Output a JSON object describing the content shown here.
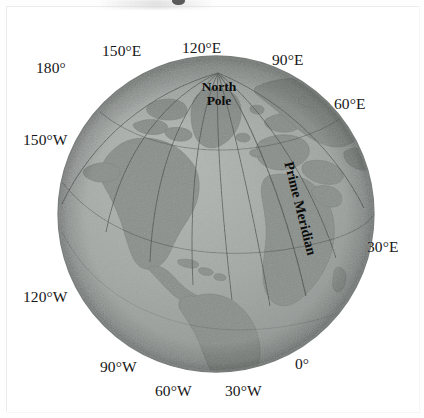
{
  "figure": {
    "type": "globe-diagram",
    "projection": "orthographic",
    "pole_label_line1": "North",
    "pole_label_line2": "Pole",
    "prime_meridian_label": "Prime Meridian",
    "colors": {
      "ocean": "#9fa5a2",
      "land": "#8b918d",
      "graticule": "#4d5250",
      "outline": "#6e7472",
      "text": "#141414",
      "page": "#ffffff"
    }
  },
  "meridian_labels": [
    {
      "id": "180",
      "text": "180°",
      "degrees": 180,
      "hemisphere": "",
      "position": "top-left"
    },
    {
      "id": "150E",
      "text": "150°E",
      "degrees": 150,
      "hemisphere": "E",
      "position": "top"
    },
    {
      "id": "120E",
      "text": "120°E",
      "degrees": 120,
      "hemisphere": "E",
      "position": "top"
    },
    {
      "id": "90E",
      "text": "90°E",
      "degrees": 90,
      "hemisphere": "E",
      "position": "top-right"
    },
    {
      "id": "60E",
      "text": "60°E",
      "degrees": 60,
      "hemisphere": "E",
      "position": "right-upper"
    },
    {
      "id": "30E",
      "text": "30°E",
      "degrees": 30,
      "hemisphere": "E",
      "position": "right"
    },
    {
      "id": "0",
      "text": "0°",
      "degrees": 0,
      "hemisphere": "",
      "position": "bottom-right"
    },
    {
      "id": "30W",
      "text": "30°W",
      "degrees": 30,
      "hemisphere": "W",
      "position": "bottom"
    },
    {
      "id": "60W",
      "text": "60°W",
      "degrees": 60,
      "hemisphere": "W",
      "position": "bottom"
    },
    {
      "id": "90W",
      "text": "90°W",
      "degrees": 90,
      "hemisphere": "W",
      "position": "bottom-left"
    },
    {
      "id": "120W",
      "text": "120°W",
      "degrees": 120,
      "hemisphere": "W",
      "position": "left-lower"
    },
    {
      "id": "150W",
      "text": "150°W",
      "degrees": 150,
      "hemisphere": "W",
      "position": "left-upper"
    }
  ]
}
